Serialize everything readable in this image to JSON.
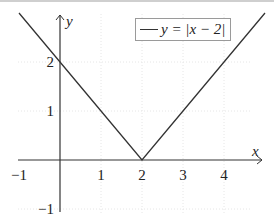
{
  "chart_data": {
    "type": "line",
    "title": "",
    "xlabel": "x",
    "ylabel": "y",
    "xlim": [
      -1,
      5
    ],
    "ylim": [
      -1,
      3
    ],
    "x_ticks": [
      -1,
      1,
      2,
      3,
      4
    ],
    "y_ticks": [
      -1,
      1,
      2
    ],
    "x_tick_labels": [
      "−1",
      "1",
      "2",
      "3",
      "4"
    ],
    "y_tick_labels": [
      "−1",
      "1",
      "2"
    ],
    "grid": true,
    "legend_position": "upper right",
    "series": [
      {
        "name": "y = |x − 2|",
        "x": [
          -1,
          0,
          1,
          2,
          3,
          4,
          5
        ],
        "values": [
          3,
          2,
          1,
          0,
          1,
          2,
          3
        ],
        "color": "#333333"
      }
    ]
  },
  "legend": {
    "label": "y = |x − 2|"
  },
  "axes": {
    "x_label": "x",
    "y_label": "y"
  },
  "colors": {
    "line": "#333333",
    "axis": "#333333",
    "grid": "#e6e6e6"
  }
}
